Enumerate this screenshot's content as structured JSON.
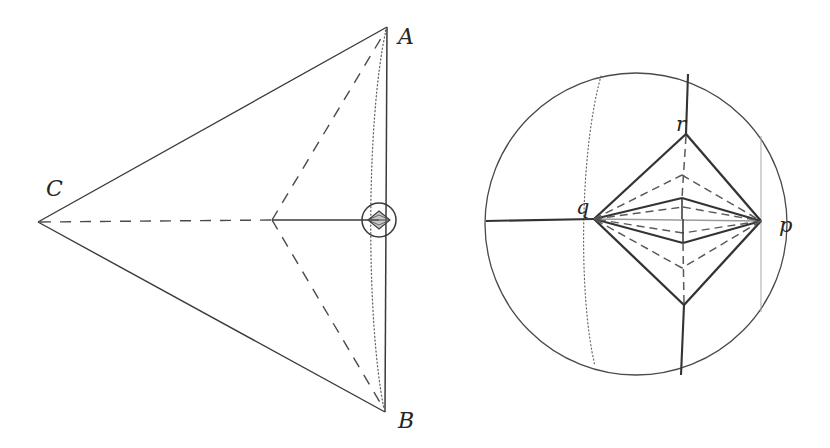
{
  "figure": {
    "kind": "geometric-diagram-pair",
    "background_color": "#ffffff",
    "ink_color": "#333333",
    "label_color": "#262626",
    "faint_color": "#8c8c8c",
    "width": 830,
    "height": 448
  },
  "left_diagram": {
    "name": "triangle-with-inscribed-detail",
    "labels": {
      "a": "A",
      "b": "B",
      "c": "C"
    },
    "label_positions": {
      "a": {
        "x": 398,
        "y": 44
      },
      "b": {
        "x": 398,
        "y": 428
      },
      "c": {
        "x": 46,
        "y": 196
      }
    },
    "vertices": {
      "A": {
        "x": 387,
        "y": 27
      },
      "B": {
        "x": 385,
        "y": 412
      },
      "C": {
        "x": 38,
        "y": 222
      },
      "midnode": {
        "x": 272,
        "y": 220
      },
      "detail_center": {
        "x": 379,
        "y": 220
      }
    },
    "detail_circle_radius": 17,
    "inner_diamond": {
      "half_width": 11,
      "half_height": 9
    }
  },
  "right_diagram": {
    "name": "disk-with-lens-cell-complex",
    "labels": {
      "p": "p",
      "q": "q",
      "r": "r"
    },
    "label_positions": {
      "p": {
        "x": 779,
        "y": 222
      },
      "q": {
        "x": 579,
        "y": 212
      },
      "r": {
        "x": 679,
        "y": 131
      }
    },
    "circle": {
      "cx": 636,
      "cy": 224,
      "r": 151
    },
    "vertices": {
      "p": {
        "x": 761,
        "y": 221
      },
      "q": {
        "x": 594,
        "y": 219
      },
      "r": {
        "x": 686,
        "y": 134
      },
      "s_bottom": {
        "x": 684,
        "y": 305
      },
      "mid_upper": {
        "x": 682,
        "y": 198
      },
      "mid_lower": {
        "x": 683,
        "y": 243
      },
      "inner_upper": {
        "x": 682,
        "y": 175
      },
      "inner_lower": {
        "x": 682,
        "y": 268
      }
    },
    "rays": {
      "left_equator_start": {
        "x": 486,
        "y": 221
      },
      "top_spoke_start": {
        "x": 688,
        "y": 74
      },
      "bottom_spoke_end": {
        "x": 681,
        "y": 375
      }
    },
    "dotted_meridian": {
      "top": {
        "x": 601,
        "y": 76
      },
      "bottom": {
        "x": 595,
        "y": 366
      },
      "bulge_x": 579
    },
    "faint_vertical": {
      "x": 761,
      "top": {
        "y": 136
      },
      "bottom": {
        "y": 312
      }
    }
  }
}
